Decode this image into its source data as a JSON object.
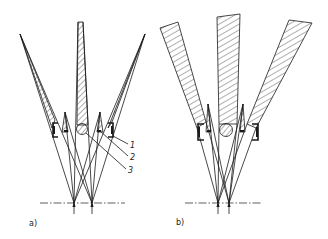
{
  "figure": {
    "panels": [
      {
        "id": "a",
        "label": "a)",
        "callouts": [
          {
            "number": "1"
          },
          {
            "number": "2"
          },
          {
            "number": "3"
          }
        ]
      },
      {
        "id": "b",
        "label": "b)"
      }
    ],
    "colors": {
      "line": "#1a1a1a",
      "background": "#ffffff"
    }
  }
}
